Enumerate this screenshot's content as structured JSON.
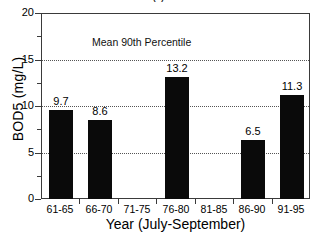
{
  "figure": {
    "title_remnant": "(                              )",
    "annotation": "Mean 90th Percentile",
    "background_color": "#ffffff",
    "bar_color": "#0a0a0a",
    "frame_color": "#3a3a3a",
    "gridline_color": "#555555"
  },
  "chart_data": {
    "type": "bar",
    "title": "",
    "xlabel": "Year (July-September)",
    "ylabel": "BOD5 (mg/L)",
    "categories": [
      "61-65",
      "66-70",
      "71-75",
      "76-80",
      "81-85",
      "86-90",
      "91-95"
    ],
    "values": [
      9.7,
      8.6,
      null,
      13.2,
      null,
      6.5,
      11.3
    ],
    "value_labels": [
      "9.7",
      "8.6",
      "",
      "13.2",
      "",
      "6.5",
      "11.3"
    ],
    "ylim": [
      0,
      20
    ],
    "ytick_labels": [
      "0",
      "5",
      "10",
      "15",
      "20"
    ],
    "ytick_values": [
      0,
      5,
      10,
      15,
      20
    ],
    "yminor_values": [
      2.5,
      7.5,
      12.5,
      17.5
    ],
    "gridlines": [
      5,
      10,
      15
    ],
    "grid": true,
    "legend": null,
    "annotations": [
      "Mean 90th Percentile"
    ]
  }
}
